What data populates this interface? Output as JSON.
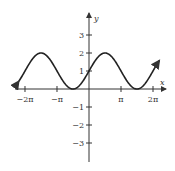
{
  "chart_data": {
    "type": "line",
    "title": "",
    "function": "y = 1 + sin(x)",
    "xlabel": "x",
    "ylabel": "y",
    "x_ticks": [
      "-2π",
      "-π",
      "π",
      "2π"
    ],
    "x_tick_values": [
      -6.2832,
      -3.1416,
      3.1416,
      6.2832
    ],
    "y_ticks": [
      "3",
      "2",
      "1",
      "-1",
      "-2",
      "-3"
    ],
    "y_tick_values": [
      3,
      2,
      1,
      -1,
      -2,
      -3
    ],
    "xlim": [
      -7.0,
      7.2
    ],
    "ylim": [
      -4.0,
      4.1
    ],
    "grid": false,
    "series": [
      {
        "name": "1 + sin x",
        "x": [
          -6.9,
          -6.2832,
          -4.7124,
          -3.1416,
          -1.5708,
          0,
          1.5708,
          3.1416,
          4.7124,
          6.2832,
          6.9
        ],
        "values": [
          0.42,
          1,
          2,
          1,
          0,
          1,
          2,
          1,
          0,
          1,
          1.58
        ]
      }
    ],
    "colors": {
      "curve": "#222222",
      "axes": "#333333"
    }
  }
}
